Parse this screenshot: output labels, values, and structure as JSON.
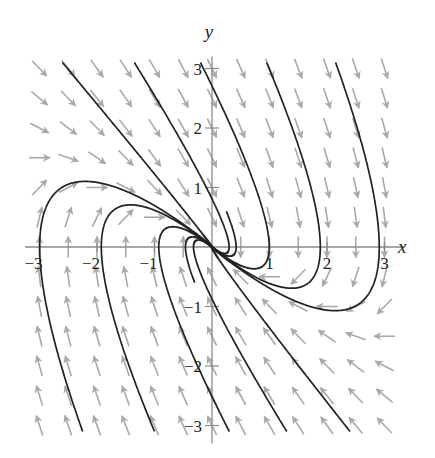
{
  "chart_data": {
    "type": "vector-field",
    "title": "",
    "xlabel": "x",
    "ylabel": "y",
    "xlim": [
      -3.1,
      3.2
    ],
    "ylim": [
      -3.1,
      3.1
    ],
    "x_ticks": [
      -3,
      -2,
      -1,
      1,
      2,
      3
    ],
    "y_ticks": [
      -3,
      -2,
      -1,
      1,
      2,
      3
    ],
    "x_tick_labels": [
      "−3",
      "−2",
      "−1",
      "1",
      "2",
      "3"
    ],
    "y_tick_labels": [
      "−3",
      "−2",
      "−1",
      "1",
      "2",
      "3"
    ],
    "grid": false,
    "system": {
      "dx_dt": "y",
      "dy_dt": "-x - 2y",
      "equilibrium": [
        0,
        0
      ],
      "classification": "degenerate stable node (repeated eigenvalue -1, eigenvector (1,-1))"
    },
    "vector_field": {
      "x_range": [
        -3,
        3
      ],
      "y_range": [
        -3,
        3
      ],
      "step": 0.5,
      "color": "#a9a9a9"
    },
    "trajectories": {
      "color": "#222222",
      "initial_points": [
        [
          -2.6,
          3.1
        ],
        [
          -1.35,
          3.1
        ],
        [
          -0.2,
          3.1
        ],
        [
          0.95,
          3.1
        ],
        [
          2.15,
          3.1
        ],
        [
          -2.25,
          -3.1
        ],
        [
          -1.0,
          -3.1
        ],
        [
          -0.3,
          -0.6
        ],
        [
          0.3,
          -3.1
        ],
        [
          1.3,
          -3.1
        ],
        [
          2.4,
          -3.1
        ],
        [
          0.25,
          0.6
        ]
      ]
    }
  },
  "axes": {
    "origin_px": [
      212,
      247
    ],
    "scale_px": [
      57.5,
      59.5
    ]
  }
}
